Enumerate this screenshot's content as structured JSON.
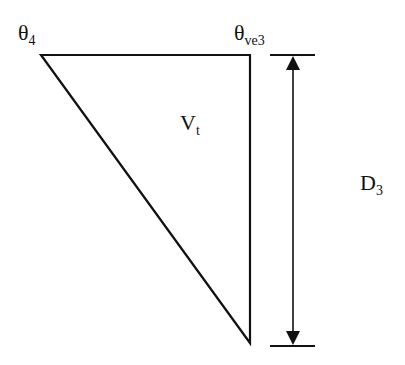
{
  "diagram": {
    "labels": {
      "top_left": {
        "base": "θ",
        "sub": "4"
      },
      "top_right": {
        "base": "θ",
        "sub": "ve3"
      },
      "interior": {
        "base": "V",
        "sub": "t"
      },
      "dimension": {
        "base": "D",
        "sub": "3"
      }
    },
    "colors": {
      "stroke": "#111111",
      "background": "#ffffff"
    }
  }
}
